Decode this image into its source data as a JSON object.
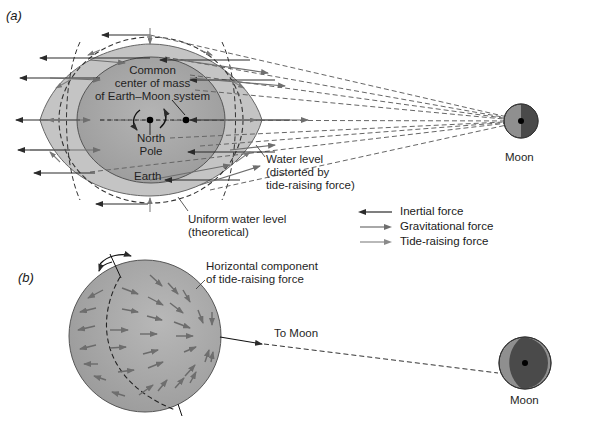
{
  "figure": {
    "panel_a": {
      "tag": "a",
      "labels": {
        "center_of_mass_line1": "Common",
        "center_of_mass_line2": "center of mass",
        "center_of_mass_line3": "of Earth–Moon system",
        "north_pole_line1": "North",
        "north_pole_line2": "Pole",
        "earth": "Earth",
        "moon": "Moon",
        "water_level_line1": "Water level",
        "water_level_line2": "(distorted by",
        "water_level_line3": "tide-raising force)",
        "uniform_line1": "Uniform water level",
        "uniform_line2": "(theoretical)"
      }
    },
    "legend": [
      {
        "label": "Inertial force",
        "color": "#2b2b2b",
        "direction": "left"
      },
      {
        "label": "Gravitational force",
        "color": "#6e6e6e",
        "direction": "right"
      },
      {
        "label": "Tide-raising force",
        "color": "#8a8a8a",
        "direction": "right"
      }
    ],
    "panel_b": {
      "tag": "b",
      "labels": {
        "horizontal_line1": "Horizontal component",
        "horizontal_line2": "of tide-raising force",
        "to_moon": "To Moon",
        "moon": "Moon"
      }
    },
    "colors": {
      "water": "#c4c4c4",
      "earth": "#a9a9a9",
      "earth_b": "#a3a3a3",
      "moon_light": "#8f8f8f",
      "moon_dark": "#4a4a4a",
      "outline": "#555555",
      "dashed": "#5a5a5a"
    }
  }
}
